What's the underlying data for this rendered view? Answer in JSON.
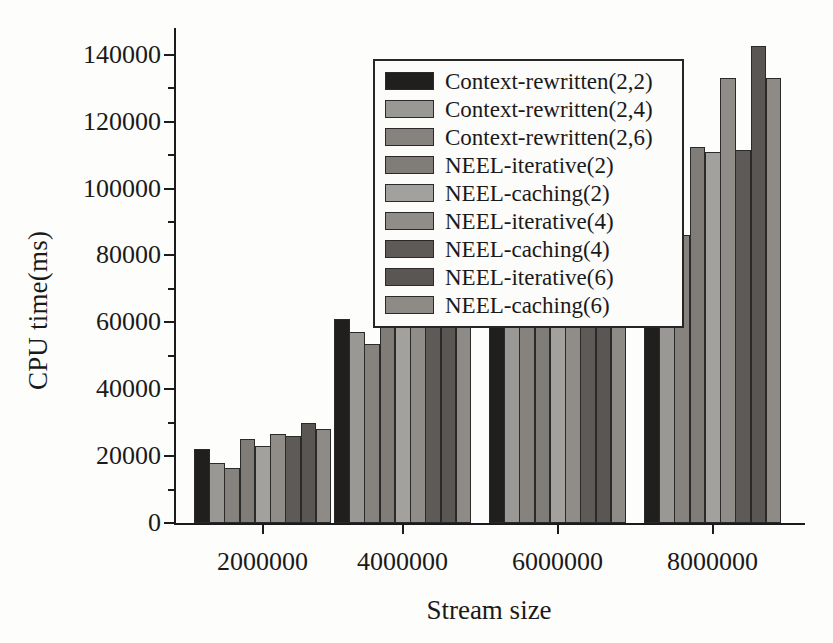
{
  "chart_data": {
    "type": "bar",
    "title": "",
    "subtitle": "",
    "xlabel": "Stream size",
    "ylabel": "CPU time(ms)",
    "categories": [
      "2000000",
      "4000000",
      "6000000",
      "8000000"
    ],
    "ylim": [
      0,
      148000
    ],
    "yticks": [
      0,
      20000,
      40000,
      60000,
      80000,
      100000,
      120000,
      140000
    ],
    "ytick_labels": [
      "0",
      "20000",
      "40000",
      "60000",
      "80000",
      "100000",
      "120000",
      "140000"
    ],
    "grid": false,
    "legend_position": "upper-left-inside",
    "series": [
      {
        "name": "Context-rewritten(2,2)",
        "color": "#211f1e",
        "values": [
          22000,
          61000,
          95500,
          101000
        ]
      },
      {
        "name": "Context-rewritten(2,4)",
        "color": "#9a9894",
        "values": [
          18000,
          57000,
          82500,
          91500
        ]
      },
      {
        "name": "Context-rewritten(2,6)",
        "color": "#86837f",
        "values": [
          16500,
          53500,
          80500,
          86000
        ]
      },
      {
        "name": "NEEL-iterative(2)",
        "color": "#807d79",
        "values": [
          25000,
          66000,
          98500,
          112500
        ]
      },
      {
        "name": "NEEL-caching(2)",
        "color": "#a3a19d",
        "values": [
          23000,
          63000,
          97000,
          111000
        ]
      },
      {
        "name": "NEEL-iterative(4)",
        "color": "#908d89",
        "values": [
          26500,
          69000,
          100000,
          133000
        ]
      },
      {
        "name": "NEEL-caching(4)",
        "color": "#5d5a57",
        "values": [
          26000,
          64500,
          99500,
          111500
        ]
      },
      {
        "name": "NEEL-iterative(6)",
        "color": "#595653",
        "values": [
          30000,
          72000,
          112000,
          142500
        ]
      },
      {
        "name": "NEEL-caching(6)",
        "color": "#8e8b87",
        "values": [
          28000,
          68500,
          109500,
          133000
        ]
      }
    ]
  }
}
